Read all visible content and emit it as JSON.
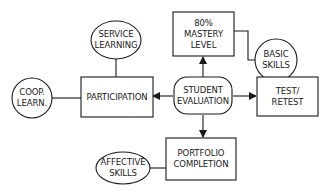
{
  "diagram": {
    "type": "concept-map",
    "line_color": "#1a1a1a",
    "background": "#ffffff",
    "center": {
      "id": "student-evaluation",
      "lines": [
        "STUDENT",
        "EVALUATION"
      ],
      "shape": "rounded-rectangle"
    },
    "nodes": [
      {
        "id": "mastery-level",
        "lines": [
          "80%",
          "MASTERY",
          "LEVEL"
        ],
        "shape": "rectangle"
      },
      {
        "id": "basic-skills",
        "lines": [
          "BASIC",
          "SKILLS"
        ],
        "shape": "circle"
      },
      {
        "id": "test-retest",
        "lines": [
          "TEST/",
          "RETEST"
        ],
        "shape": "rectangle"
      },
      {
        "id": "portfolio-completion",
        "lines": [
          "PORTFOLIO",
          "COMPLETION"
        ],
        "shape": "rectangle"
      },
      {
        "id": "affective-skills",
        "lines": [
          "AFFECTIVE",
          "SKILLS"
        ],
        "shape": "ellipse"
      },
      {
        "id": "participation",
        "lines": [
          "PARTICIPATION"
        ],
        "shape": "rectangle"
      },
      {
        "id": "service-learning",
        "lines": [
          "SERVICE",
          "LEARNING"
        ],
        "shape": "ellipse"
      },
      {
        "id": "coop-learn",
        "lines": [
          "COOP.",
          "LEARN."
        ],
        "shape": "circle"
      }
    ],
    "edges": [
      {
        "from": "student-evaluation",
        "to": "mastery-level",
        "arrow": true
      },
      {
        "from": "student-evaluation",
        "to": "test-retest",
        "arrow": true
      },
      {
        "from": "student-evaluation",
        "to": "portfolio-completion",
        "arrow": true
      },
      {
        "from": "student-evaluation",
        "to": "participation",
        "arrow": true
      },
      {
        "from": "mastery-level",
        "to": "basic-skills",
        "arrow": false
      },
      {
        "from": "portfolio-completion",
        "to": "affective-skills",
        "arrow": false
      },
      {
        "from": "participation",
        "to": "service-learning",
        "arrow": false
      },
      {
        "from": "participation",
        "to": "coop-learn",
        "arrow": false
      }
    ]
  }
}
